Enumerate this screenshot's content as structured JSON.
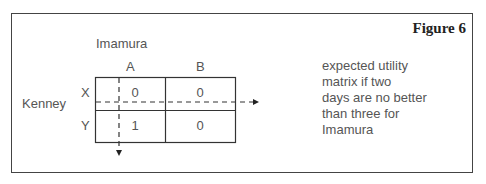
{
  "figure": {
    "title": "Figure 6",
    "column_player": "Imamura",
    "row_player": "Kenney",
    "columns": [
      "A",
      "B"
    ],
    "rows": [
      "X",
      "Y"
    ],
    "matrix": [
      [
        "0",
        "0"
      ],
      [
        "1",
        "0"
      ]
    ],
    "caption_lines": [
      "expected utility",
      "matrix if two",
      "days are no better",
      "than three for",
      "Imamura"
    ],
    "annotations": {
      "horizontal_dashed_arrow": "right",
      "vertical_dashed_arrow": "down"
    }
  }
}
